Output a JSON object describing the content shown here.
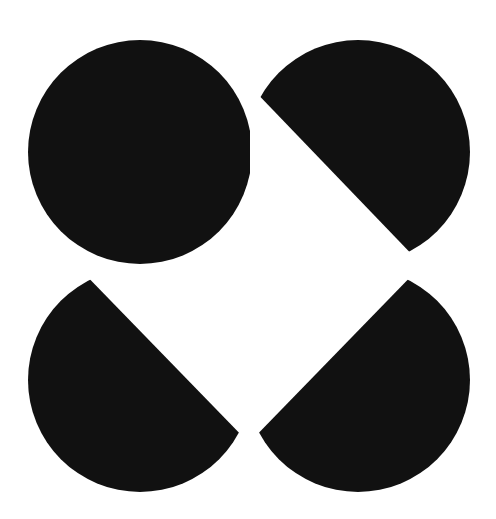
{
  "canvas": {
    "width": 496,
    "height": 519,
    "background": "#ffffff"
  },
  "figure": {
    "fill": "#111111",
    "radius": 112,
    "lobes": [
      {
        "name": "top-left",
        "cx": 140,
        "cy": 152
      },
      {
        "name": "top-right",
        "cx": 358,
        "cy": 152
      },
      {
        "name": "bottom-left",
        "cx": 140,
        "cy": 380
      },
      {
        "name": "bottom-right",
        "cx": 358,
        "cy": 380
      }
    ],
    "diamond": {
      "top": [
        250,
        86
      ],
      "right": [
        422,
        265
      ],
      "bottom": [
        249,
        443
      ],
      "left": [
        76,
        265
      ]
    },
    "square_notch_corner": [
      250,
      266
    ]
  }
}
